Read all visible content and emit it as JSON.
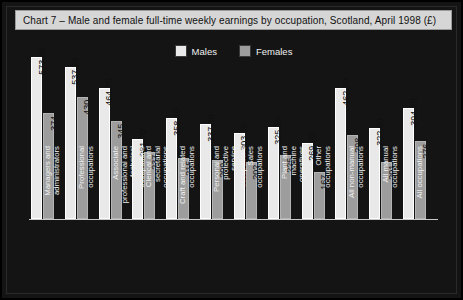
{
  "chart_data": {
    "type": "bar",
    "title": "Chart 7 – Male and female full-time weekly earnings by occupation, Scotland, April 1998 (£)",
    "xlabel": "",
    "ylabel": "",
    "ylim": [
      0,
      573.4
    ],
    "grid": false,
    "legend_position": "top-center",
    "categories": [
      "Managers and administrators",
      "Professional occupations",
      "Associate professional and technical occupations",
      "Clerical and secretarial occupations",
      "Craft and related occupations",
      "Personal and protective service occupations",
      "Sales occupations",
      "Plant and machine operatives",
      "Other occupations",
      "All non-manual occupations",
      "All manual occupations",
      "All occupations"
    ],
    "series": [
      {
        "name": "Males",
        "color": "#e9e9e9",
        "values": [
          573.4,
          537.2,
          464.7,
          281.7,
          358.4,
          337.3,
          303.2,
          325.2,
          269.7,
          462.3,
          322.6,
          394.6
        ],
        "labels": [
          "573.40",
          "537.20",
          "464.70",
          "281.70",
          "358.40",
          "337.30",
          "303.20",
          "325.20",
          "269.70",
          "462.30",
          "322.60",
          "394.60"
        ]
      },
      {
        "name": "Females",
        "color": "#9d9d9d",
        "values": [
          374.1,
          430.3,
          345.6,
          237.9,
          215.4,
          209.2,
          202.4,
          225.9,
          167.5,
          298.2,
          201.1,
          276.7
        ],
        "labels": [
          "374.10",
          "430.30",
          "345.60",
          "237.90",
          "215.40",
          "209.20",
          "202.40",
          "225.90",
          "167.50",
          "298.20",
          "201.10",
          "276.70"
        ]
      }
    ]
  },
  "title": {
    "text": "Chart 7 – Male and female full-time weekly earnings by occupation, Scotland, April 1998 (£)"
  },
  "legend": {
    "items": [
      {
        "label": "Males",
        "color": "#e9e9e9"
      },
      {
        "label": "Females",
        "color": "#9d9d9d"
      }
    ]
  }
}
